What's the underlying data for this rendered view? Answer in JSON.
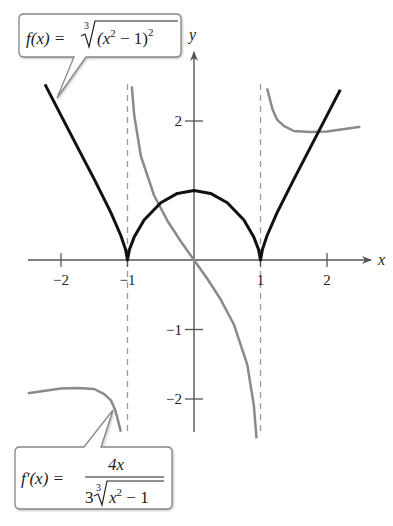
{
  "chart_data": {
    "type": "line",
    "title": "",
    "xlabel": "x",
    "ylabel": "y",
    "xlim": [
      -2.5,
      2.6
    ],
    "ylim": [
      -2.5,
      2.5
    ],
    "grid": false,
    "x_ticks": [
      {
        "value": -2,
        "label": "−2"
      },
      {
        "value": -1,
        "label": "−1"
      },
      {
        "value": 1,
        "label": "1"
      },
      {
        "value": 2,
        "label": "2"
      }
    ],
    "y_ticks": [
      {
        "value": 2,
        "label": "2"
      },
      {
        "value": -1,
        "label": "−1"
      },
      {
        "value": -2,
        "label": "−2"
      }
    ],
    "asymptotes": [
      {
        "x": -1,
        "style": "dashed"
      },
      {
        "x": 1,
        "style": "dashed"
      }
    ],
    "series": [
      {
        "name": "f(x)",
        "formula": "f(x) = cbrt((x^2 - 1)^2)",
        "color": "#111111",
        "width": 3,
        "points": [
          [
            -2.24,
            2.527
          ],
          [
            -2,
            2.08
          ],
          [
            -1.75,
            1.62
          ],
          [
            -1.5,
            1.16
          ],
          [
            -1.25,
            0.681
          ],
          [
            -1.1,
            0.353
          ],
          [
            -1.03,
            0.155
          ],
          [
            -1,
            0
          ],
          [
            -0.97,
            0.152
          ],
          [
            -0.9,
            0.33
          ],
          [
            -0.75,
            0.576
          ],
          [
            -0.5,
            0.825
          ],
          [
            -0.25,
            0.958
          ],
          [
            0,
            1
          ],
          [
            0.25,
            0.958
          ],
          [
            0.5,
            0.825
          ],
          [
            0.75,
            0.576
          ],
          [
            0.9,
            0.33
          ],
          [
            0.97,
            0.152
          ],
          [
            1,
            0
          ],
          [
            1.03,
            0.155
          ],
          [
            1.1,
            0.353
          ],
          [
            1.25,
            0.681
          ],
          [
            1.5,
            1.16
          ],
          [
            1.75,
            1.62
          ],
          [
            2,
            2.08
          ],
          [
            2.2,
            2.45
          ]
        ]
      },
      {
        "name": "f'(x) left branch",
        "formula": "f'(x) = 4x / (3 cbrt(x^2 - 1)), x < -1",
        "color": "#8a8a8a",
        "width": 2.5,
        "points": [
          [
            -2.5,
            -1.918
          ],
          [
            -2,
            -1.849
          ],
          [
            -1.75,
            -1.84
          ],
          [
            -1.5,
            -1.856
          ],
          [
            -1.35,
            -1.93
          ],
          [
            -1.25,
            -2.019
          ],
          [
            -1.18,
            -2.17
          ],
          [
            -1.1,
            -2.469
          ]
        ]
      },
      {
        "name": "f'(x) middle branch",
        "formula": "f'(x) = 4x / (3 cbrt(x^2 - 1)), -1 < x < 1",
        "color": "#8a8a8a",
        "width": 2.5,
        "points": [
          [
            -0.935,
            2.5
          ],
          [
            -0.9,
            2.087
          ],
          [
            -0.8,
            1.5
          ],
          [
            -0.6,
            0.928
          ],
          [
            -0.4,
            0.565
          ],
          [
            -0.2,
            0.27
          ],
          [
            0,
            0
          ],
          [
            0.2,
            -0.27
          ],
          [
            0.4,
            -0.565
          ],
          [
            0.6,
            -0.928
          ],
          [
            0.8,
            -1.5
          ],
          [
            0.9,
            -2.087
          ],
          [
            0.94,
            -2.567
          ]
        ]
      },
      {
        "name": "f'(x) right branch",
        "formula": "f'(x) = 4x / (3 cbrt(x^2 - 1)), x > 1",
        "color": "#8a8a8a",
        "width": 2.5,
        "points": [
          [
            1.1,
            2.469
          ],
          [
            1.18,
            2.17
          ],
          [
            1.25,
            2.019
          ],
          [
            1.35,
            1.93
          ],
          [
            1.5,
            1.856
          ],
          [
            1.75,
            1.84
          ],
          [
            2,
            1.849
          ],
          [
            2.5,
            1.918
          ]
        ]
      }
    ],
    "annotations": [
      {
        "id": "f",
        "text": "f(x) = ∛((x² − 1)²)"
      },
      {
        "id": "fprime",
        "text": "f′(x) = 4x / (3∛(x² − 1))"
      }
    ]
  },
  "callouts": {
    "f": {
      "lhs": "f(x) =",
      "index": "3",
      "radicand_open": "(x",
      "exp_inner": "2",
      "radicand_mid": " − 1)",
      "exp_outer": "2"
    },
    "fprime": {
      "lhs": "f′(x) =",
      "numerator": "4x",
      "coef": "3",
      "index": "3",
      "radicand": "x",
      "exp": "2",
      "radicand_tail": " − 1"
    }
  },
  "axes": {
    "x_label": "x",
    "y_label": "y"
  }
}
